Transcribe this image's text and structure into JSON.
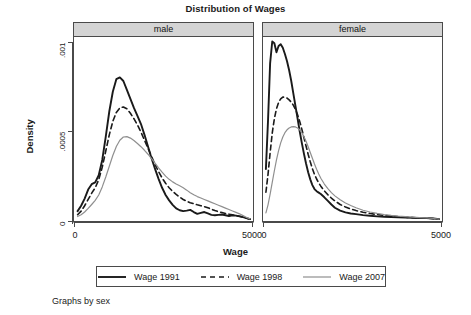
{
  "chart_data": {
    "type": "line",
    "title": "Distribution of Wages",
    "xlabel": "Wage",
    "ylabel": "Density",
    "footnote": "Graphs by sex",
    "grid": false,
    "legend_position": "bottom",
    "xlim": [
      0,
      5000
    ],
    "ylim": [
      0,
      0.00105
    ],
    "xticks": [
      0,
      5000
    ],
    "xtick_labels": [
      "0",
      "5000"
    ],
    "yticks": [
      0,
      0.0005,
      0.001
    ],
    "ytick_labels": [
      "0",
      ".0005",
      ".001"
    ],
    "panels": [
      {
        "label": "male",
        "series": [
          {
            "name": "Wage 1991",
            "color": "#1a1a1a",
            "style": "solid",
            "width": 1.9,
            "x": [
              60,
              160,
              260,
              360,
              460,
              560,
              660,
              760,
              860,
              960,
              1060,
              1160,
              1260,
              1360,
              1460,
              1560,
              1660,
              1760,
              1860,
              1960,
              2060,
              2160,
              2260,
              2360,
              2460,
              2560,
              2660,
              2760,
              2860,
              2960,
              3060,
              3160,
              3260,
              3360,
              3460,
              3560,
              3660,
              3760,
              3860,
              3960,
              4060,
              4160,
              4260,
              4360,
              4460,
              4560,
              4660,
              4760,
              4860,
              4960
            ],
            "y": [
              5.5e-05,
              8.5e-05,
              0.000125,
              0.000175,
              0.000205,
              0.000215,
              0.000255,
              0.00034,
              0.00047,
              0.00061,
              0.00072,
              0.00079,
              0.0008,
              0.00078,
              0.00073,
              0.00068,
              0.00063,
              0.000585,
              0.00054,
              0.00048,
              0.000415,
              0.00035,
              0.00029,
              0.000235,
              0.000185,
              0.000145,
              0.000115,
              9e-05,
              7e-05,
              6e-05,
              5.5e-05,
              5.8e-05,
              6.2e-05,
              5e-05,
              4e-05,
              4.5e-05,
              5e-05,
              4.2e-05,
              3.4e-05,
              3.2e-05,
              3.4e-05,
              3.6e-05,
              3.2e-05,
              2.8e-05,
              3.2e-05,
              3e-05,
              2.6e-05,
              2.2e-05,
              1.6e-05,
              1e-05
            ]
          },
          {
            "name": "Wage 1998",
            "color": "#1a1a1a",
            "style": "dashed",
            "width": 1.6,
            "x": [
              60,
              160,
              260,
              360,
              460,
              560,
              660,
              760,
              860,
              960,
              1060,
              1160,
              1260,
              1360,
              1460,
              1560,
              1660,
              1760,
              1860,
              1960,
              2060,
              2160,
              2260,
              2360,
              2460,
              2560,
              2660,
              2760,
              2860,
              2960,
              3060,
              3160,
              3260,
              3360,
              3460,
              3560,
              3660,
              3760,
              3860,
              3960,
              4060,
              4160,
              4260,
              4360,
              4460,
              4560,
              4660,
              4760,
              4860,
              4960
            ],
            "y": [
              3.5e-05,
              5.5e-05,
              8.5e-05,
              0.00012,
              0.000155,
              0.000185,
              0.00023,
              0.0003,
              0.00039,
              0.00048,
              0.000555,
              0.000605,
              0.00063,
              0.000635,
              0.000625,
              0.0006,
              0.00057,
              0.000535,
              0.000495,
              0.00045,
              0.000405,
              0.00036,
              0.000315,
              0.000275,
              0.00024,
              0.00021,
              0.000185,
              0.000165,
              0.000148,
              0.000133,
              0.00012,
              0.00011,
              0.000102,
              9.6e-05,
              9e-05,
              8.5e-05,
              8e-05,
              7.4e-05,
              6.6e-05,
              5.8e-05,
              5.2e-05,
              4.7e-05,
              4.2e-05,
              3.8e-05,
              3.4e-05,
              3e-05,
              2.6e-05,
              2.1e-05,
              1.5e-05,
              1e-05
            ]
          },
          {
            "name": "Wage 2007",
            "color": "#8f8f8f",
            "style": "solid",
            "width": 1.2,
            "x": [
              60,
              160,
              260,
              360,
              460,
              560,
              660,
              760,
              860,
              960,
              1060,
              1160,
              1260,
              1360,
              1460,
              1560,
              1660,
              1760,
              1860,
              1960,
              2060,
              2160,
              2260,
              2360,
              2460,
              2560,
              2660,
              2760,
              2860,
              2960,
              3060,
              3160,
              3260,
              3360,
              3460,
              3560,
              3660,
              3760,
              3860,
              3960,
              4060,
              4160,
              4260,
              4360,
              4460,
              4560,
              4660,
              4760,
              4860,
              4960
            ],
            "y": [
              2.5e-05,
              3.5e-05,
              5e-05,
              7e-05,
              9.2e-05,
              0.000115,
              0.000145,
              0.00019,
              0.000245,
              0.000305,
              0.000365,
              0.000415,
              0.00045,
              0.000468,
              0.00047,
              0.000462,
              0.000448,
              0.000432,
              0.000414,
              0.000394,
              0.000372,
              0.000348,
              0.000322,
              0.000296,
              0.000272,
              0.00025,
              0.000232,
              0.000218,
              0.000206,
              0.000196,
              0.000185,
              0.000172,
              0.000158,
              0.000146,
              0.000136,
              0.000128,
              0.00012,
              0.000112,
              0.000104,
              9.6e-05,
              8.8e-05,
              8e-05,
              7.2e-05,
              6.4e-05,
              5.6e-05,
              4.8e-05,
              4e-05,
              3e-05,
              2e-05,
              1.2e-05
            ]
          }
        ]
      },
      {
        "label": "female",
        "series": [
          {
            "name": "Wage 1991",
            "color": "#1a1a1a",
            "style": "solid",
            "width": 1.9,
            "x": [
              40,
              100,
              160,
              220,
              280,
              340,
              400,
              460,
              520,
              580,
              640,
              700,
              760,
              820,
              880,
              940,
              1000,
              1060,
              1120,
              1180,
              1240,
              1300,
              1360,
              1420,
              1480,
              1540,
              1600,
              1700,
              1800,
              1900,
              2000,
              2150,
              2300,
              2450,
              2600,
              2800,
              3000,
              3200,
              3400,
              3600,
              3800,
              4000,
              4200,
              4400,
              4600,
              4800,
              4960
            ],
            "y": [
              0.00029,
              0.00056,
              0.00088,
              0.001,
              0.00099,
              0.00094,
              0.000975,
              0.000985,
              0.000965,
              0.00093,
              0.00089,
              0.00084,
              0.00078,
              0.00071,
              0.00064,
              0.00057,
              0.0005,
              0.000435,
              0.000375,
              0.00032,
              0.000272,
              0.000232,
              0.0002,
              0.000178,
              0.000166,
              0.000158,
              0.00015,
              0.000132,
              0.000112,
              9.2e-05,
              7.4e-05,
              5.8e-05,
              4.8e-05,
              4.2e-05,
              3.8e-05,
              3.3e-05,
              2.9e-05,
              2.6e-05,
              2.4e-05,
              2.2e-05,
              2e-05,
              1.9e-05,
              1.8e-05,
              1.7e-05,
              1.6e-05,
              1.4e-05,
              1e-05
            ]
          },
          {
            "name": "Wage 1998",
            "color": "#1a1a1a",
            "style": "dashed",
            "width": 1.6,
            "x": [
              40,
              100,
              160,
              220,
              280,
              340,
              400,
              460,
              520,
              580,
              640,
              700,
              760,
              820,
              880,
              940,
              1000,
              1060,
              1120,
              1180,
              1240,
              1300,
              1360,
              1420,
              1480,
              1540,
              1600,
              1700,
              1800,
              1900,
              2000,
              2150,
              2300,
              2450,
              2600,
              2800,
              3000,
              3200,
              3400,
              3600,
              3800,
              4000,
              4200,
              4400,
              4600,
              4800,
              4960
            ],
            "y": [
              0.00016,
              0.00026,
              0.00038,
              0.00049,
              0.00057,
              0.000625,
              0.00066,
              0.00068,
              0.00069,
              0.00069,
              0.000685,
              0.000675,
              0.000662,
              0.000645,
              0.000622,
              0.000592,
              0.000555,
              0.000512,
              0.000465,
              0.000418,
              0.000372,
              0.00033,
              0.000292,
              0.00026,
              0.000234,
              0.000212,
              0.000194,
              0.000168,
              0.000146,
              0.000128,
              0.000112,
              9.2e-05,
              7.8e-05,
              6.7e-05,
              5.8e-05,
              4.9e-05,
              4.2e-05,
              3.6e-05,
              3.1e-05,
              2.7e-05,
              2.4e-05,
              2.1e-05,
              1.9e-05,
              1.7e-05,
              1.6e-05,
              1.3e-05,
              1e-05
            ]
          },
          {
            "name": "Wage 2007",
            "color": "#8f8f8f",
            "style": "solid",
            "width": 1.2,
            "x": [
              40,
              100,
              160,
              220,
              280,
              340,
              400,
              460,
              520,
              580,
              640,
              700,
              760,
              820,
              880,
              940,
              1000,
              1060,
              1120,
              1180,
              1240,
              1300,
              1360,
              1420,
              1480,
              1540,
              1600,
              1700,
              1800,
              1900,
              2000,
              2150,
              2300,
              2450,
              2600,
              2800,
              3000,
              3200,
              3400,
              3600,
              3800,
              4000,
              4200,
              4400,
              4600,
              4800,
              4960
            ],
            "y": [
              4.5e-05,
              9e-05,
              0.00015,
              0.000215,
              0.00028,
              0.00034,
              0.000392,
              0.000435,
              0.000468,
              0.000492,
              0.000508,
              0.000518,
              0.000524,
              0.000526,
              0.000524,
              0.000518,
              0.000508,
              0.000492,
              0.00047,
              0.000444,
              0.000414,
              0.000382,
              0.00035,
              0.000318,
              0.000288,
              0.000262,
              0.000238,
              0.000206,
              0.00018,
              0.000158,
              0.00014,
              0.000118,
              0.0001,
              8.6e-05,
              7.4e-05,
              6e-05,
              5e-05,
              4.2e-05,
              3.6e-05,
              3.1e-05,
              2.7e-05,
              2.4e-05,
              2.1e-05,
              1.9e-05,
              1.7e-05,
              1.4e-05,
              1e-05
            ]
          }
        ]
      }
    ],
    "legend": [
      {
        "label": "Wage 1991",
        "color": "#1a1a1a",
        "style": "solid",
        "width": 1.9
      },
      {
        "label": "Wage 1998",
        "color": "#1a1a1a",
        "style": "dashed",
        "width": 1.6
      },
      {
        "label": "Wage 2007",
        "color": "#8f8f8f",
        "style": "solid",
        "width": 1.2
      }
    ]
  }
}
